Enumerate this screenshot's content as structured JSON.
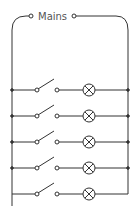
{
  "diagram": {
    "title": "Mains",
    "type": "parallel lighting circuit",
    "branch_count": 5,
    "branches": [
      {
        "switch": "open",
        "lamp": "lamp-1"
      },
      {
        "switch": "open",
        "lamp": "lamp-2"
      },
      {
        "switch": "open",
        "lamp": "lamp-3"
      },
      {
        "switch": "open",
        "lamp": "lamp-4"
      },
      {
        "switch": "open",
        "lamp": "lamp-5"
      }
    ],
    "colors": {
      "wire": "#333333",
      "text": "#555555",
      "background": "#ffffff"
    }
  }
}
